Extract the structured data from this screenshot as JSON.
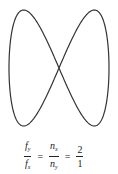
{
  "figure": {
    "type": "lissajous",
    "stroke_color": "#333333",
    "x_frequency": 1,
    "y_frequency": 2
  },
  "formula": {
    "lhs_num": "f",
    "lhs_num_sub": "y",
    "lhs_den": "f",
    "lhs_den_sub": "x",
    "mid_num": "n",
    "mid_num_sub": "x",
    "mid_den": "n",
    "mid_den_sub": "y",
    "rhs_num": "2",
    "rhs_den": "1",
    "eq1": "=",
    "eq2": "="
  }
}
